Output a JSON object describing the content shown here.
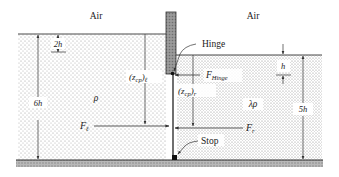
{
  "diagram": {
    "regions": {
      "air_left": "Air",
      "air_right": "Air",
      "left_density": "ρ",
      "right_density": "λρ"
    },
    "labels": {
      "hinge": "Hinge",
      "stop": "Stop",
      "f_hinge_main": "F",
      "f_hinge_sub": "Hinge",
      "f_left_main": "F",
      "f_left_sub": "ℓ",
      "f_right_main": "F",
      "f_right_sub": "r",
      "zcp_left_open": "(z",
      "zcp_left_sub": "cp",
      "zcp_left_close": ")",
      "zcp_left_sub2": "ℓ",
      "zcp_right_open": "(z",
      "zcp_right_sub": "cp",
      "zcp_right_close": ")",
      "zcp_right_sub2": "r"
    },
    "dimensions": {
      "left_depth": "6h",
      "left_gap": "2h",
      "right_depth": "5h",
      "right_gap": "h"
    },
    "colors": {
      "water_dots": "#9a9a9a",
      "gate_fill": "#8c8c8c",
      "ground_fill": "#a8a8a8",
      "line": "#333333"
    }
  }
}
